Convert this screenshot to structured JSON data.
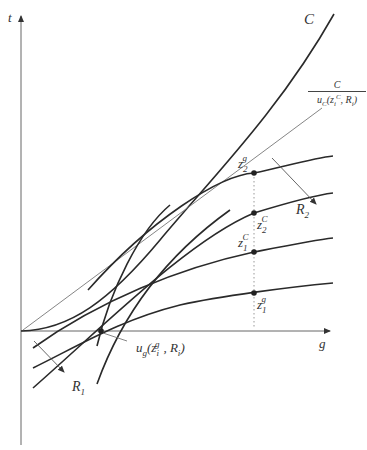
{
  "diagram": {
    "type": "economic-geometric-diagram",
    "axes": {
      "y_label": "t",
      "x_label": "g"
    },
    "curves": [
      {
        "id": "C",
        "label": "C",
        "style": "thick",
        "description": "convex cost curve rising from origin"
      },
      {
        "id": "C_over_uC",
        "label_num": "C",
        "label_den": "u",
        "label_den_sub": "C",
        "label_den_args": "(z",
        "label_den_sub2": "i",
        "label_den_sup2": "C",
        "label_den_tail": ", R",
        "label_den_sub3": "i",
        "label_den_close": ")",
        "style": "thin",
        "description": "ray line from origin"
      },
      {
        "id": "z2g_curve",
        "style": "thick"
      },
      {
        "id": "z2C_curve",
        "style": "thick"
      },
      {
        "id": "z1C_curve",
        "style": "thick"
      },
      {
        "id": "z1g_curve",
        "style": "thick"
      },
      {
        "id": "R1_steep_a",
        "style": "thick"
      },
      {
        "id": "R1_steep_b",
        "style": "thick"
      }
    ],
    "points": [
      {
        "id": "z2g",
        "main": "z",
        "sub": "2",
        "sup": "g"
      },
      {
        "id": "z2C",
        "main": "z",
        "sub": "2",
        "sup": "C"
      },
      {
        "id": "z1C",
        "main": "z",
        "sub": "1",
        "sup": "C"
      },
      {
        "id": "z1g",
        "main": "z",
        "sub": "1",
        "sup": "g"
      }
    ],
    "annotations": {
      "R1": {
        "main": "R",
        "sub": "1"
      },
      "R2": {
        "main": "R",
        "sub": "2"
      },
      "ug": {
        "main": "u",
        "sub": "g",
        "open": "(z",
        "isub": "i",
        "isup": "g",
        "mid": ", R",
        "rsub": "i",
        "close": ")"
      }
    },
    "colors": {
      "ink": "#2a2a2a",
      "thin_line": "#777777",
      "axis": "#666666",
      "dotted": "#999999"
    }
  }
}
